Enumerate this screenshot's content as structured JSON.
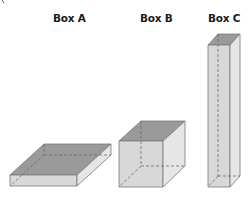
{
  "figure": {
    "labels": {
      "box_a": "Box A",
      "box_b": "Box B",
      "box_c": "Box C"
    },
    "colors": {
      "top_face": "#9a9a9a",
      "front_face": "#d8d8d8",
      "side_face": "#e6e6e6",
      "edge": "#7a7a7a",
      "hidden_edge": "#6a6a6a"
    }
  }
}
